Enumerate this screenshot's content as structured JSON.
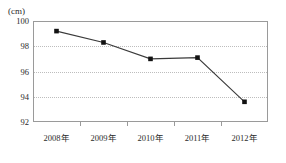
{
  "chart_data": {
    "type": "line",
    "title": "",
    "subtitle": "",
    "xlabel": "",
    "ylabel": "",
    "unit_label": "(cm)",
    "categories": [
      "2008年",
      "2009年",
      "2010年",
      "2011年",
      "2012年"
    ],
    "series": [
      {
        "name": "",
        "values": [
          99.2,
          98.3,
          97.0,
          97.1,
          93.6
        ]
      }
    ],
    "ylim": [
      92,
      100
    ],
    "yticks": [
      100,
      98,
      96,
      94,
      92
    ],
    "ytick_labels": [
      "100",
      "98",
      "96",
      "94",
      "92"
    ],
    "grid": true,
    "grid_axis": "y",
    "legend": "none",
    "marker": "square",
    "line_color": "#3a3a3a",
    "marker_color": "#121212",
    "frame_color": "#9a9a9a",
    "grid_color": "#bdbdbd",
    "background": "#ffffff"
  },
  "axes": {
    "unit": "(cm)"
  }
}
